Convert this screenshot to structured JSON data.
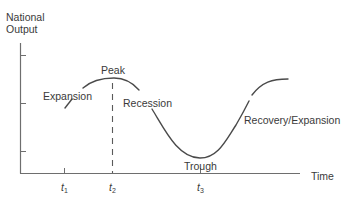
{
  "diagram": {
    "y_axis_label_line1": "National",
    "y_axis_label_line2": "Output",
    "x_axis_label": "Time",
    "phases": {
      "expansion": "Expansion",
      "peak": "Peak",
      "recession": "Recession",
      "trough": "Trough",
      "recovery": "Recovery/Expansion"
    },
    "time_markers": [
      {
        "symbol": "t",
        "subscript": "1",
        "meaning": "start"
      },
      {
        "symbol": "t",
        "subscript": "2",
        "meaning": "peak"
      },
      {
        "symbol": "t",
        "subscript": "3",
        "meaning": "trough"
      }
    ],
    "colors": {
      "line": "#4a4a4a",
      "axis": "#6e6e6e",
      "text": "#3a3a3a"
    }
  }
}
